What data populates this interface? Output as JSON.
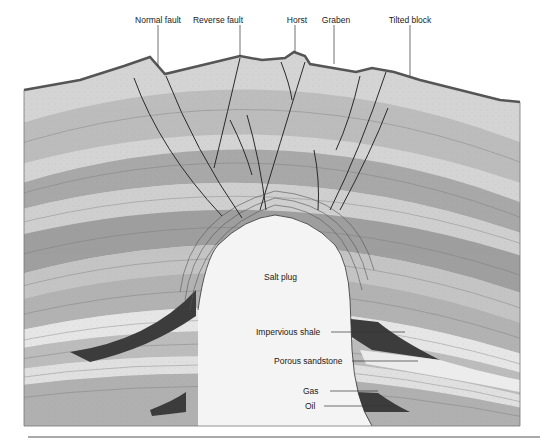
{
  "figure": {
    "top_labels": [
      {
        "id": "normal-fault",
        "text": "Normal fault",
        "x": 134
      },
      {
        "id": "reverse-fault",
        "text": "Reverse fault",
        "x": 218
      },
      {
        "id": "horst",
        "text": "Horst",
        "x": 297
      },
      {
        "id": "graben",
        "text": "Graben",
        "x": 336
      },
      {
        "id": "tilted-block",
        "text": "Tilted block",
        "x": 410
      }
    ],
    "inner_labels": {
      "salt_plug": "Salt plug",
      "impervious_shale": "Impervious shale",
      "porous_sandstone": "Porous sandstone",
      "gas": "Gas",
      "oil": "Oil"
    },
    "colors": {
      "background": "#ffffff",
      "rock_light": "#d9d9d9",
      "rock_mid": "#b8b8b8",
      "rock_dark": "#9a9a9a",
      "salt": "#f4f4f4",
      "shale": "#3c3c3c",
      "surface": "#555555",
      "lines": "#2a2a2a"
    }
  }
}
